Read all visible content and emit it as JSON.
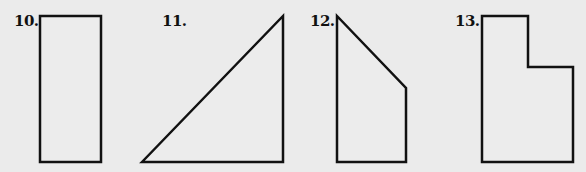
{
  "colors": {
    "background": "#ebebeb",
    "stroke": "#111111",
    "fill": "#ececec"
  },
  "figures": [
    {
      "label": "10.",
      "shape": "rectangle",
      "points": "40,16 101,16 101,162 40,162",
      "label_x": 14
    },
    {
      "label": "11.",
      "shape": "right-triangle",
      "points": "142,162 283,16 283,162",
      "label_x": 162
    },
    {
      "label": "12.",
      "shape": "trapezoid",
      "points": "337,16 406,88 406,162 337,162",
      "label_x": 310
    },
    {
      "label": "13.",
      "shape": "l-shape",
      "points": "482,16 528,16 528,67 573,67 573,162 482,162",
      "label_x": 455
    }
  ]
}
